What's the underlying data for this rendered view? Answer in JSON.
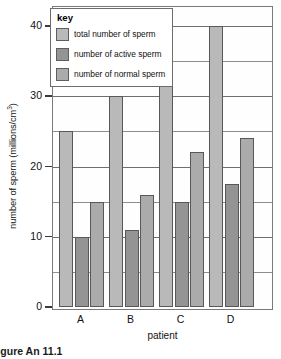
{
  "chart_data": {
    "type": "bar",
    "title": "",
    "xlabel": "patient",
    "ylabel": "number of sperm (millions/cm3)",
    "ylabel_main": "number of sperm (millions/cm",
    "ylabel_sup": "3",
    "ylabel_tail": ")",
    "categories": [
      "A",
      "B",
      "C",
      "D"
    ],
    "ylim": [
      0,
      40
    ],
    "ytick_labels": [
      "0",
      "10",
      "20",
      "30",
      "40"
    ],
    "ytick_values": [
      0,
      10,
      20,
      30,
      40
    ],
    "gridline_values": [
      5,
      10,
      15,
      20,
      25,
      30,
      35,
      40
    ],
    "grid": true,
    "legend_position": "top-left",
    "series": [
      {
        "name": "total number of sperm",
        "key": "total",
        "color": "#b9b9b9",
        "values": [
          25,
          30,
          35,
          40
        ]
      },
      {
        "name": "number of active sperm",
        "key": "active",
        "color": "#949494",
        "values": [
          10,
          11,
          15,
          17.5
        ]
      },
      {
        "name": "number of normal sperm",
        "key": "normal",
        "color": "#ababab",
        "values": [
          15,
          16,
          22,
          24
        ]
      }
    ]
  },
  "legend": {
    "title": "key",
    "items": [
      {
        "label": "total number of sperm",
        "color": "#b9b9b9"
      },
      {
        "label": "number of active sperm",
        "color": "#949494"
      },
      {
        "label": "number of normal sperm",
        "color": "#ababab"
      }
    ]
  },
  "caption": "Figure An 11.1"
}
